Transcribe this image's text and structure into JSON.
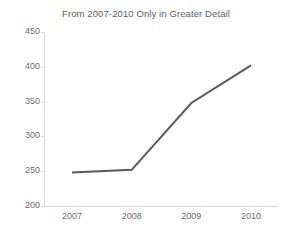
{
  "chart_data": {
    "type": "line",
    "title": "From 2007-2010 Only in Greater Detail",
    "xlabel": "",
    "ylabel": "",
    "categories": [
      "2007",
      "2008",
      "2009",
      "2010"
    ],
    "x": [
      2007,
      2008,
      2009,
      2010
    ],
    "series": [
      {
        "name": "series-1",
        "values": [
          248,
          252,
          348,
          402
        ],
        "color": "#595959",
        "line_width": 2,
        "markers": false
      }
    ],
    "values": [
      248,
      252,
      348,
      402
    ],
    "ylim": [
      200,
      450
    ],
    "yticks": [
      200,
      250,
      300,
      350,
      400,
      450
    ],
    "ytick_labels": [
      "200",
      "250",
      "300",
      "350",
      "400",
      "450"
    ],
    "xtick_labels": [
      "2007",
      "2008",
      "2009",
      "2010"
    ],
    "grid": false,
    "legend": false,
    "legend_position": "none",
    "axis_color": "#d9d9d9",
    "tick_label_color": "#6b6b6b",
    "title_color": "#606060",
    "background": "#ffffff"
  }
}
